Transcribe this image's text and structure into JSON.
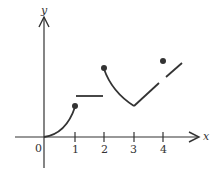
{
  "figure": {
    "type": "piecewise-function-graph",
    "axes": {
      "x_label": "x",
      "y_label": "y",
      "origin_label": "0",
      "x_ticks": [
        "1",
        "2",
        "3",
        "4"
      ]
    },
    "colors": {
      "stroke": "#333333",
      "background": "#ffffff"
    },
    "pieces": [
      {
        "name": "curve-0-to-1",
        "description": "concave-up curve from origin, closed dot at x=1"
      },
      {
        "name": "horizontal-1-to-2",
        "description": "horizontal segment between x=1 and x=2"
      },
      {
        "name": "curve-2-to-3",
        "description": "closed dot at x=2, curve down to minimum at x=3"
      },
      {
        "name": "line-3-to-4",
        "description": "line rising from x=3 toward x=4, open at x=4"
      },
      {
        "name": "point-at-4",
        "description": "isolated closed dot above at x=4"
      },
      {
        "name": "line-after-4",
        "description": "line segment continuing beyond x=4"
      }
    ]
  }
}
